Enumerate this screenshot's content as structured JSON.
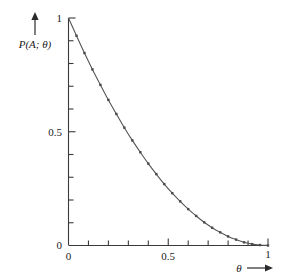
{
  "figure": {
    "background_color": "#ffffff",
    "axis_color": "#3a3a3a",
    "curve_color": "#555555",
    "marker_color": "#4a4a4a",
    "y_axis_label": "P(A; θ)",
    "x_axis_label": "θ",
    "y_arrow_icon": "up-arrow-icon",
    "x_arrow_icon": "right-arrow-icon"
  },
  "chart_data": {
    "type": "line",
    "title": "",
    "subtitle": "",
    "xlabel": "θ",
    "ylabel": "P(A; θ)",
    "xlim": [
      0,
      1
    ],
    "ylim": [
      0,
      1
    ],
    "grid": false,
    "legend": null,
    "x_tick_labels": [
      "0",
      "0.5",
      "1"
    ],
    "x_tick_values": [
      0,
      0.5,
      1
    ],
    "y_tick_labels": [
      "0",
      "0.5",
      "1"
    ],
    "y_tick_values": [
      0,
      0.5,
      1
    ],
    "x_minor_tick_values": [
      0.1,
      0.2,
      0.3,
      0.4,
      0.6,
      0.7,
      0.8,
      0.9
    ],
    "y_minor_tick_values": [
      0.1,
      0.2,
      0.3,
      0.4,
      0.6,
      0.7,
      0.8,
      0.9
    ],
    "series": [
      {
        "name": "P(A; θ)",
        "marker": "square",
        "x": [
          0.0,
          0.04,
          0.08,
          0.12,
          0.16,
          0.2,
          0.24,
          0.28,
          0.32,
          0.36,
          0.4,
          0.44,
          0.48,
          0.52,
          0.56,
          0.6,
          0.64,
          0.68,
          0.72,
          0.76,
          0.8,
          0.84,
          0.88,
          0.92,
          0.96,
          1.0
        ],
        "values": [
          1.0,
          0.922,
          0.846,
          0.774,
          0.706,
          0.64,
          0.578,
          0.518,
          0.462,
          0.41,
          0.36,
          0.314,
          0.27,
          0.23,
          0.194,
          0.16,
          0.13,
          0.102,
          0.078,
          0.058,
          0.04,
          0.026,
          0.014,
          0.006,
          0.002,
          0.0
        ]
      }
    ],
    "annotations": []
  }
}
